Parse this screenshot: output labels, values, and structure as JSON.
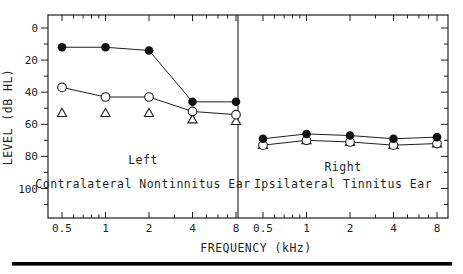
{
  "colors": {
    "ink": "#1f1f1f",
    "paper": "#ffffff",
    "marker_fill": "#111111",
    "marker_open_fill": "#ffffff"
  },
  "footer": {
    "rule_color": "#000000"
  },
  "chart_data": {
    "type": "line",
    "x_scale": "log2",
    "x": [
      0.5,
      1,
      2,
      4,
      8
    ],
    "x_ticks_labeled": [
      "0.5",
      "1",
      "2",
      "4",
      "8"
    ],
    "x_minor_ticks": [
      0.6,
      0.7,
      0.8,
      0.9,
      3,
      5,
      6,
      7
    ],
    "xlabel": "FREQUENCY (kHz)",
    "ylabel": "LEVEL (dB HL)",
    "y_major_ticks": [
      0,
      20,
      40,
      60,
      80,
      100
    ],
    "y_minor_ticks": [
      10,
      30,
      50,
      70,
      90,
      110
    ],
    "ylim_top_to_bottom": [
      -8,
      118
    ],
    "y_axis_inverted": true,
    "grid": false,
    "legend": "none",
    "panels": [
      {
        "title_line1": "Left",
        "title_line2": "Contralateral Nontinnitus Ear",
        "series": [
          {
            "name": "filled-circle",
            "marker": "filled-circle",
            "line": true,
            "values": [
              12,
              12,
              14,
              46,
              46
            ]
          },
          {
            "name": "open-circle",
            "marker": "open-circle",
            "line": true,
            "values": [
              37,
              43,
              43,
              52,
              54
            ]
          },
          {
            "name": "open-triangle",
            "marker": "open-triangle",
            "line": false,
            "values": [
              53,
              53,
              53,
              57,
              58
            ]
          }
        ]
      },
      {
        "title_line1": "Right",
        "title_line2": "Ipsilateral Tinnitus Ear",
        "series": [
          {
            "name": "filled-circle",
            "marker": "filled-circle",
            "line": true,
            "values": [
              69,
              66,
              67,
              69,
              68
            ]
          },
          {
            "name": "open-circle",
            "marker": "open-circle",
            "line": true,
            "values": [
              73,
              70,
              71,
              73,
              72
            ]
          },
          {
            "name": "open-triangle",
            "marker": "open-triangle",
            "line": false,
            "values": [
              73,
              70,
              71,
              73,
              72
            ]
          }
        ]
      }
    ]
  }
}
